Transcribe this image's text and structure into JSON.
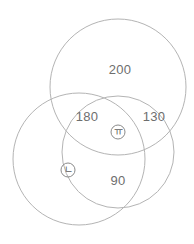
{
  "figure": {
    "type": "venn-diagram",
    "stroke_color": "#b4b4b4",
    "label_color": "#6e6e6e",
    "marker_color": "#5d5d5d",
    "background_color": "#ffffff",
    "circles": [
      {
        "name": "top-circle",
        "cx": 118,
        "cy": 87,
        "r": 68
      },
      {
        "name": "bottom-left-circle",
        "cx": 79,
        "cy": 159,
        "r": 66
      },
      {
        "name": "bottom-right-circle",
        "cx": 118,
        "cy": 152,
        "r": 56
      }
    ],
    "region_labels": [
      {
        "name": "top-region-value",
        "text": "200",
        "x": 120,
        "y": 69
      },
      {
        "name": "left-overlap-value",
        "text": "180",
        "x": 87,
        "y": 116
      },
      {
        "name": "right-overlap-value",
        "text": "130",
        "x": 154,
        "y": 116
      },
      {
        "name": "bottom-overlap-value",
        "text": "90",
        "x": 118,
        "y": 180
      }
    ],
    "markers": [
      {
        "name": "center-region-marker",
        "text": "ㅠ",
        "glyph": "circled-kiyeok",
        "x": 118,
        "y": 132
      },
      {
        "name": "left-region-marker",
        "text": "ㄴ",
        "glyph": "circled-nieun",
        "x": 68,
        "y": 170
      }
    ]
  },
  "chart_data": {
    "type": "venn",
    "title": "",
    "sets": [
      {
        "name": "A",
        "label": "top-circle"
      },
      {
        "name": "B",
        "label": "bottom-left-circle"
      },
      {
        "name": "C",
        "label": "bottom-right-circle"
      }
    ],
    "regions": [
      {
        "region": "A only",
        "value": 200,
        "label": "200"
      },
      {
        "region": "A ∩ B only",
        "value": 180,
        "label": "180"
      },
      {
        "region": "A ∩ C only",
        "value": 130,
        "label": "130"
      },
      {
        "region": "B ∩ C only",
        "value": 90,
        "label": "90"
      },
      {
        "region": "A ∩ B ∩ C",
        "value": null,
        "label": "ㅠ"
      },
      {
        "region": "B only",
        "value": null,
        "label": "ㄴ"
      }
    ],
    "values": [
      200,
      180,
      130,
      90
    ],
    "categories": [
      "200",
      "180",
      "130",
      "90"
    ],
    "xlabel": "",
    "ylabel": "",
    "grid": false,
    "legend": "none"
  }
}
